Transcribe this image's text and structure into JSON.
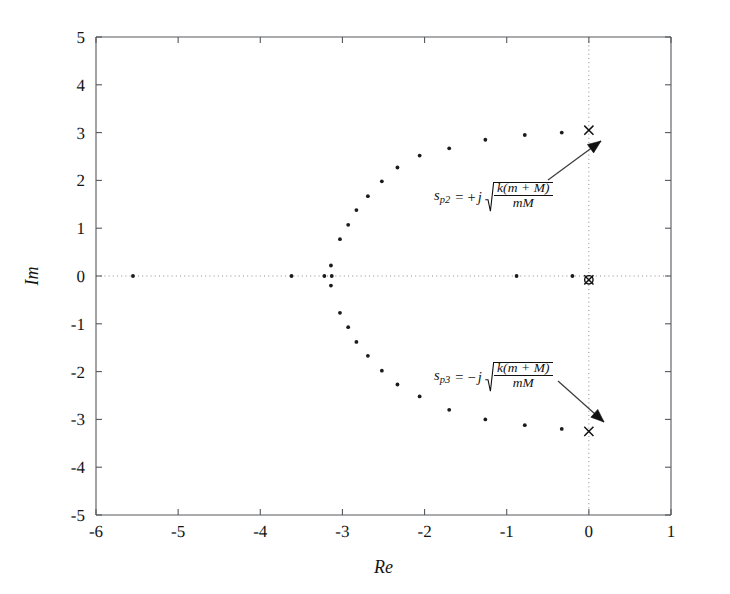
{
  "figure": {
    "title": "",
    "background_color": "#ffffff",
    "axis_color": "#55585c",
    "grid_color": "#8a8d92",
    "marker_color": "#111111"
  },
  "axes": {
    "x_title": "Re",
    "y_title": "Im",
    "x_ticks": [
      "-6",
      "-5",
      "-4",
      "-3",
      "-2",
      "-1",
      "0",
      "1"
    ],
    "y_ticks": [
      "5",
      "4",
      "3",
      "2",
      "1",
      "0",
      "-1",
      "-2",
      "-3",
      "-4",
      "-5"
    ],
    "xlim": [
      -6,
      1
    ],
    "ylim": [
      -5,
      5
    ]
  },
  "annotations": [
    {
      "id": "sp2",
      "symbol": "s",
      "subscript": "p2",
      "equals": "=",
      "sign": "+",
      "imag": "j",
      "numerator": "k(m + M)",
      "denominator": "mM",
      "target_x": 0.0,
      "target_y": 3.05
    },
    {
      "id": "sp3",
      "symbol": "s",
      "subscript": "p3",
      "equals": "=",
      "sign": "−",
      "imag": "j",
      "numerator": "k(m + M)",
      "denominator": "mM",
      "target_x": 0.0,
      "target_y": -3.25
    }
  ],
  "chart_data": {
    "type": "scatter",
    "title": "",
    "xlabel": "Re",
    "ylabel": "Im",
    "xlim": [
      -6,
      1
    ],
    "ylim": [
      -5,
      5
    ],
    "grid": "dotted-axes-only",
    "legend": "none",
    "series": [
      {
        "name": "root-locus-branch-real-axis",
        "marker": "dot",
        "points": [
          [
            -5.55,
            0.0
          ],
          [
            -3.62,
            0.0
          ],
          [
            -3.22,
            0.0
          ],
          [
            -3.13,
            0.0
          ],
          [
            -0.88,
            0.0
          ],
          [
            -0.2,
            0.0
          ]
        ]
      },
      {
        "name": "root-locus-branch-breakaway-vertical",
        "marker": "dot",
        "points": [
          [
            -3.14,
            0.22
          ],
          [
            -3.14,
            -0.2
          ]
        ]
      },
      {
        "name": "root-locus-branch-upper",
        "marker": "dot",
        "points": [
          [
            -3.03,
            0.77
          ],
          [
            -2.93,
            1.07
          ],
          [
            -2.83,
            1.38
          ],
          [
            -2.69,
            1.67
          ],
          [
            -2.52,
            1.98
          ],
          [
            -2.33,
            2.27
          ],
          [
            -2.06,
            2.52
          ],
          [
            -1.7,
            2.67
          ],
          [
            -1.26,
            2.85
          ],
          [
            -0.78,
            2.95
          ],
          [
            -0.33,
            3.0
          ]
        ]
      },
      {
        "name": "root-locus-branch-lower",
        "marker": "dot",
        "points": [
          [
            -3.03,
            -0.77
          ],
          [
            -2.93,
            -1.07
          ],
          [
            -2.83,
            -1.38
          ],
          [
            -2.69,
            -1.67
          ],
          [
            -2.52,
            -1.98
          ],
          [
            -2.33,
            -2.27
          ],
          [
            -2.06,
            -2.52
          ],
          [
            -1.7,
            -2.8
          ],
          [
            -1.26,
            -3.0
          ],
          [
            -0.78,
            -3.12
          ],
          [
            -0.33,
            -3.2
          ]
        ]
      },
      {
        "name": "open-loop-poles",
        "marker": "x",
        "points": [
          [
            0.0,
            3.05
          ],
          [
            0.0,
            -3.25
          ],
          [
            0.0,
            -0.08
          ]
        ]
      },
      {
        "name": "open-loop-zeros",
        "marker": "o",
        "points": [
          [
            0.0,
            -0.08
          ]
        ]
      }
    ]
  }
}
